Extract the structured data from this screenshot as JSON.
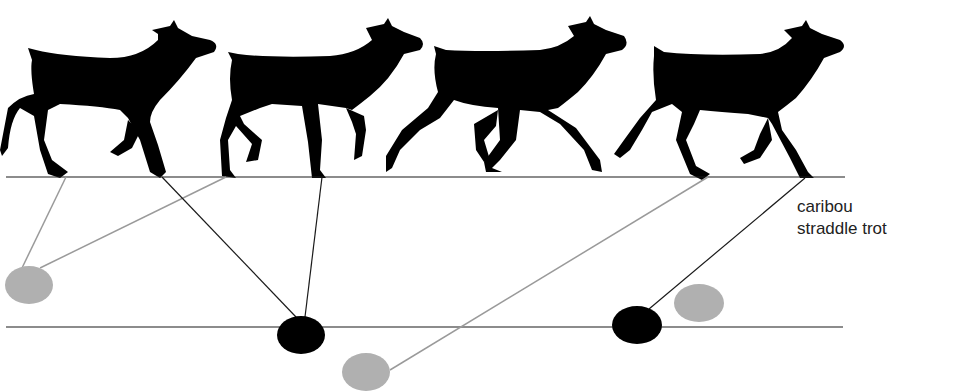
{
  "caption": {
    "line1": "caribou",
    "line2": "straddle trot"
  },
  "colors": {
    "silhouette": "#000000",
    "gray_print": "#b0b0b0",
    "black_print": "#000000",
    "line_dark": "#1a1a1a",
    "line_gray": "#9a9a9a"
  },
  "diagram": {
    "ground_lines": [
      {
        "name": "upper-ground-line",
        "x1": 6,
        "y1": 177,
        "x2": 845,
        "y2": 177
      },
      {
        "name": "lower-ground-line",
        "x1": 6,
        "y1": 327,
        "x2": 843,
        "y2": 327
      }
    ],
    "footprints": [
      {
        "name": "gray-footprint-1",
        "cx": 29,
        "cy": 285,
        "rx": 24,
        "ry": 19,
        "type": "gray"
      },
      {
        "name": "black-footprint-1",
        "cx": 301,
        "cy": 335,
        "rx": 24,
        "ry": 19,
        "type": "black"
      },
      {
        "name": "gray-footprint-2",
        "cx": 366,
        "cy": 372,
        "rx": 24,
        "ry": 19,
        "type": "gray"
      },
      {
        "name": "black-footprint-2",
        "cx": 637,
        "cy": 325,
        "rx": 25,
        "ry": 19,
        "type": "black"
      },
      {
        "name": "gray-footprint-3",
        "cx": 699,
        "cy": 303,
        "rx": 25,
        "ry": 19,
        "type": "gray"
      }
    ],
    "connectors": [
      {
        "x1": 66,
        "y1": 177,
        "x2": 22,
        "y2": 268,
        "type": "gray"
      },
      {
        "x1": 226,
        "y1": 177,
        "x2": 40,
        "y2": 268,
        "type": "gray"
      },
      {
        "x1": 162,
        "y1": 177,
        "x2": 296,
        "y2": 317,
        "type": "dark"
      },
      {
        "x1": 322,
        "y1": 177,
        "x2": 305,
        "y2": 317,
        "type": "dark"
      },
      {
        "x1": 708,
        "y1": 177,
        "x2": 390,
        "y2": 370,
        "type": "gray"
      },
      {
        "x1": 805,
        "y1": 178,
        "x2": 649,
        "y2": 309,
        "type": "dark"
      }
    ]
  }
}
